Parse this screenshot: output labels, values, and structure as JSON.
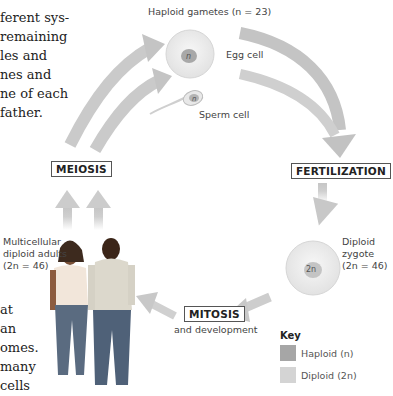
{
  "text_fragments": {
    "top": [
      "ferent sys-",
      "remaining",
      "les and",
      "nes and",
      "ne of each",
      "father."
    ],
    "bottom": [
      "at",
      "an",
      "omes.",
      "many",
      "cells"
    ]
  },
  "diagram": {
    "haploid_gametes_label": "Haploid gametes (n = 23)",
    "egg_cell": {
      "label": "Egg cell",
      "nucleus": "n"
    },
    "sperm_cell": {
      "label": "Sperm cell",
      "nucleus": "n"
    },
    "fertilization": "FERTILIZATION",
    "zygote": {
      "label_lines": [
        "Diploid",
        "zygote",
        "(2n = 46)"
      ],
      "nucleus": "2n"
    },
    "mitosis": "MITOSIS",
    "mitosis_sub": "and development",
    "meiosis": "MEIOSIS",
    "adults_label_lines": [
      "Multicellular",
      "diploid adults",
      "(2n = 46)"
    ]
  },
  "key": {
    "title": "Key",
    "items": [
      {
        "label": "Haploid (n)",
        "color": "#a6a6a6"
      },
      {
        "label": "Diploid (2n)",
        "color": "#d4d4d4"
      }
    ]
  },
  "colors": {
    "arrow": "#c8c8c8",
    "haploid": "#a6a6a6",
    "diploid": "#d4d4d4",
    "cell_fill": "#ededed"
  }
}
